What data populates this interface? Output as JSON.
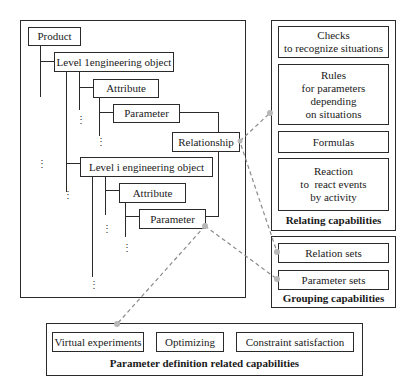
{
  "hierarchy": {
    "product": "Product",
    "level1_object": "Level 1engineering object",
    "attribute_1": "Attribute",
    "parameter_1": "Parameter",
    "relationship": "Relationship",
    "leveli_object": "Level i engineering object",
    "attribute_i": "Attribute",
    "parameter_i": "Parameter",
    "ellipsis": "⋮"
  },
  "relating": {
    "caption": "Relating capabilities",
    "items": [
      {
        "lines": [
          "Checks",
          "to recognize situations"
        ]
      },
      {
        "lines": [
          "Rules",
          "for parameters",
          "depending",
          "on situations"
        ]
      },
      {
        "lines": [
          "Formulas"
        ]
      },
      {
        "lines": [
          "Reaction",
          "to  react events",
          "by activity"
        ]
      }
    ]
  },
  "grouping": {
    "caption": "Grouping capabilities",
    "items": [
      "Relation sets",
      "Parameter sets"
    ]
  },
  "parameter_definition": {
    "caption": "Parameter definition related capabilities",
    "items": [
      "Virtual experiments",
      "Optimizing",
      "Constraint satisfaction"
    ]
  },
  "colors": {
    "line": "#2a2a2a",
    "dashed_connector": "#8a8a8a",
    "connector_dot": "#b8b8b8"
  }
}
